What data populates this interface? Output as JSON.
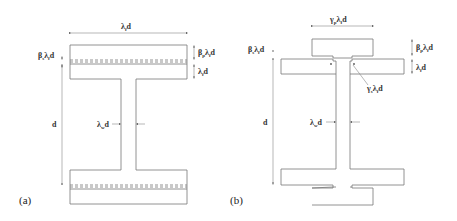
{
  "figure_a": {
    "caption": "(a)",
    "labels": {
      "flange_width": "λ_fd",
      "top_left_thickness": "β_sλ_fd",
      "top_right_plate": "β_pλ_fd",
      "top_right_flange": "λ_fd",
      "depth": "d",
      "web": "λ_wd"
    }
  },
  "figure_b": {
    "caption": "(b)",
    "labels": {
      "plate_width": "γ_pλ_fd",
      "left_gap": "β_sλ_fd",
      "right_plate": "β_pλ_fd",
      "right_flange": "λ_fd",
      "slot": "γ_sλ_fd",
      "depth": "d",
      "web": "λ_wd"
    }
  },
  "text": {
    "a_width_main": "λ",
    "a_width_sub": "f",
    "a_width_tail": "d",
    "a_bs_main": "β",
    "a_bs_sub": "s",
    "a_bs_mid": "λ",
    "a_bs_sub2": "f",
    "a_bs_tail": "d",
    "a_bp_main": "β",
    "a_bp_sub": "p",
    "a_bp_mid": "λ",
    "a_bp_sub2": "f",
    "a_bp_tail": "d",
    "a_lf_main": "λ",
    "a_lf_sub": "f",
    "a_lf_tail": "d",
    "a_d": "d",
    "a_lw_main": "λ",
    "a_lw_sub": "w",
    "a_lw_tail": "d",
    "a_cap": "(a)",
    "b_gp_main": "γ",
    "b_gp_sub": "p",
    "b_gp_mid": "λ",
    "b_gp_sub2": "f",
    "b_gp_tail": "d",
    "b_bs_main": "β",
    "b_bs_sub": "s",
    "b_bs_mid": "λ",
    "b_bs_sub2": "f",
    "b_bs_tail": "d",
    "b_bp_main": "β",
    "b_bp_sub": "p",
    "b_bp_mid": "λ",
    "b_bp_sub2": "f",
    "b_bp_tail": "d",
    "b_lf_main": "λ",
    "b_lf_sub": "f",
    "b_lf_tail": "d",
    "b_gs_main": "γ",
    "b_gs_sub": "s",
    "b_gs_mid": "λ",
    "b_gs_sub2": "f",
    "b_gs_tail": "d",
    "b_d": "d",
    "b_lw_main": "λ",
    "b_lw_sub": "w",
    "b_lw_tail": "d",
    "b_cap": "(b)"
  }
}
